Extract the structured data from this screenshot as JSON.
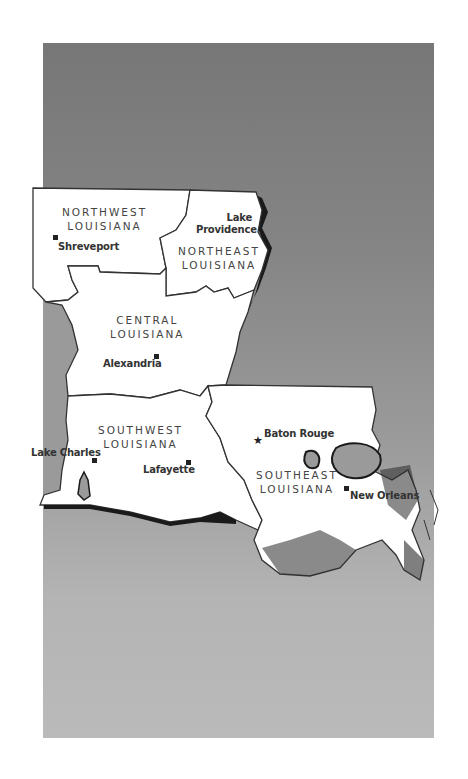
{
  "map": {
    "title": "Louisiana Regions",
    "colors": {
      "background_top": "#777777",
      "background_bottom": "#bababa",
      "land": "#ffffff",
      "border": "#333333",
      "water": "#999999",
      "shoreline": "#1a1a1a"
    },
    "regions": [
      {
        "id": "northwest",
        "line1": "NORTHWEST",
        "line2": "LOUISIANA"
      },
      {
        "id": "northeast",
        "line1": "NORTHEAST",
        "line2": "LOUISIANA"
      },
      {
        "id": "central",
        "line1": "CENTRAL",
        "line2": "LOUISIANA"
      },
      {
        "id": "southwest",
        "line1": "SOUTHWEST",
        "line2": "LOUISIANA"
      },
      {
        "id": "southeast",
        "line1": "SOUTHEAST",
        "line2": "LOUISIANA"
      }
    ],
    "cities": [
      {
        "name": "Shreveport",
        "marker": "square"
      },
      {
        "name_line1": "Lake",
        "name_line2": "Providence",
        "marker": "none"
      },
      {
        "name": "Alexandria",
        "marker": "square"
      },
      {
        "name": "Lake Charles",
        "marker": "square"
      },
      {
        "name": "Lafayette",
        "marker": "square"
      },
      {
        "name": "Baton Rouge",
        "marker": "star",
        "capital": true
      },
      {
        "name": "New Orleans",
        "marker": "square"
      }
    ],
    "icons": {
      "city": "square-marker",
      "capital": "star-marker"
    }
  }
}
